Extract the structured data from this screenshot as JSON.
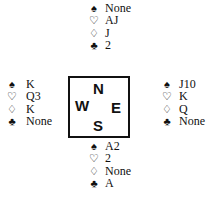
{
  "suits": {
    "spade": "♠",
    "heart": "♡",
    "diamond": "♢",
    "club": "♣"
  },
  "compass": {
    "north": "N",
    "west": "W",
    "east": "E",
    "south": "S"
  },
  "hands": {
    "north": {
      "spades": "None",
      "hearts": "AJ",
      "diamonds": "J",
      "clubs": "2"
    },
    "west": {
      "spades": "K",
      "hearts": "Q3",
      "diamonds": "K",
      "clubs": "None"
    },
    "east": {
      "spades": "J10",
      "hearts": "K",
      "diamonds": "Q",
      "clubs": "None"
    },
    "south": {
      "spades": "A2",
      "hearts": "2",
      "diamonds": "None",
      "clubs": "A"
    }
  }
}
